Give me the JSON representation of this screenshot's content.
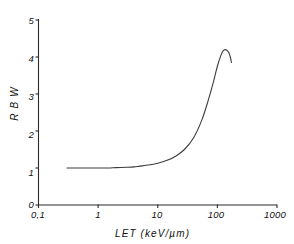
{
  "chart_data": {
    "type": "line",
    "title": "",
    "subtitle": "",
    "xlabel": "LET  (keV/µm)",
    "ylabel": "R B W",
    "xscale": "log",
    "yscale": "linear",
    "xlim": [
      0.1,
      1000
    ],
    "ylim": [
      0,
      5
    ],
    "grid": false,
    "legend": null,
    "x_tick_labels": [
      "0,1",
      "1",
      "10",
      "100",
      "1000"
    ],
    "x_tick_values": [
      0.1,
      1,
      10,
      100,
      1000
    ],
    "y_tick_labels": [
      "0",
      "1",
      "2",
      "3",
      "4",
      "5"
    ],
    "y_tick_values": [
      0,
      1,
      2,
      3,
      4,
      5
    ],
    "series": [
      {
        "name": "RBW vs LET",
        "color": "#3c3c3c",
        "x": [
          0.3,
          0.5,
          0.8,
          1.0,
          1.5,
          2.0,
          3.0,
          4.0,
          5.0,
          7.0,
          10.0,
          14.0,
          20.0,
          28.0,
          40.0,
          55.0,
          70.0,
          85.0,
          100.0,
          115.0,
          125.0,
          135.0,
          145.0,
          155.0,
          165.0,
          172.0
        ],
        "y": [
          1.0,
          1.0,
          1.0,
          1.0,
          1.0,
          1.01,
          1.02,
          1.03,
          1.05,
          1.08,
          1.13,
          1.2,
          1.32,
          1.5,
          1.82,
          2.3,
          2.82,
          3.3,
          3.75,
          4.05,
          4.17,
          4.2,
          4.18,
          4.12,
          4.0,
          3.85
        ]
      }
    ],
    "annotations": []
  },
  "axis": {
    "y_title": "R B W",
    "x_title": "LET  (keV/µm)"
  },
  "icons": {
    "x_axis_line": "x-axis-line",
    "y_axis_line": "y-axis-line"
  }
}
